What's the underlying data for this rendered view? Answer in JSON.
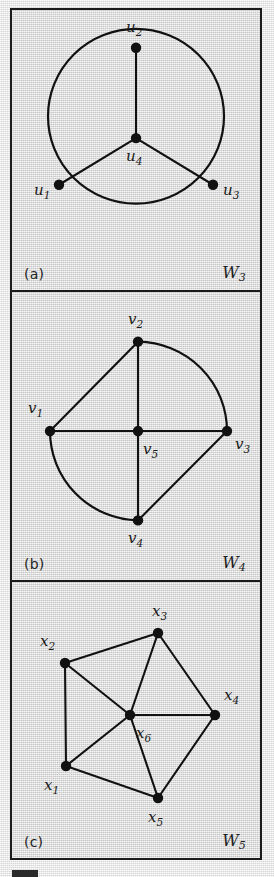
{
  "figure": {
    "background_color": "#d9d9d9",
    "stroke_color": "#111111",
    "panels": [
      {
        "id": "a",
        "caption_left": "(a)",
        "caption_right_base": "W",
        "caption_right_sub": "3",
        "graph_name": "W3",
        "vertices": [
          {
            "id": "u1",
            "base": "u",
            "sub": "1",
            "cx": 47,
            "cy": 176,
            "lx": 22,
            "ly": 186
          },
          {
            "id": "u2",
            "base": "u",
            "sub": "2",
            "cx": 124,
            "cy": 38,
            "lx": 114,
            "ly": 22
          },
          {
            "id": "u3",
            "base": "u",
            "sub": "3",
            "cx": 201,
            "cy": 176,
            "lx": 211,
            "ly": 186
          },
          {
            "id": "u4",
            "base": "u",
            "sub": "4",
            "cx": 124,
            "cy": 129,
            "lx": 114,
            "ly": 152
          }
        ],
        "edges": [
          {
            "from": "u4",
            "to": "u2",
            "kind": "straight"
          },
          {
            "from": "u4",
            "to": "u1",
            "kind": "straight"
          },
          {
            "from": "u4",
            "to": "u3",
            "kind": "straight"
          },
          {
            "from": "u2",
            "to": "u3",
            "kind": "curve"
          },
          {
            "from": "u3",
            "to": "u1",
            "kind": "curve"
          },
          {
            "from": "u1",
            "to": "u2",
            "kind": "curve"
          }
        ]
      },
      {
        "id": "b",
        "caption_left": "(b)",
        "caption_right_base": "W",
        "caption_right_sub": "4",
        "graph_name": "W4",
        "vertices": [
          {
            "id": "v1",
            "base": "v",
            "sub": "1",
            "cx": 38,
            "cy": 140,
            "lx": 16,
            "ly": 122
          },
          {
            "id": "v2",
            "base": "v",
            "sub": "2",
            "cx": 126,
            "cy": 50,
            "lx": 116,
            "ly": 32
          },
          {
            "id": "v3",
            "base": "v",
            "sub": "3",
            "cx": 215,
            "cy": 140,
            "lx": 223,
            "ly": 158
          },
          {
            "id": "v4",
            "base": "v",
            "sub": "4",
            "cx": 126,
            "cy": 230,
            "lx": 116,
            "ly": 253
          },
          {
            "id": "v5",
            "base": "v",
            "sub": "5",
            "cx": 126,
            "cy": 140,
            "lx": 131,
            "ly": 163
          }
        ],
        "edges": [
          {
            "from": "v5",
            "to": "v1",
            "kind": "straight"
          },
          {
            "from": "v5",
            "to": "v2",
            "kind": "straight"
          },
          {
            "from": "v5",
            "to": "v3",
            "kind": "straight"
          },
          {
            "from": "v5",
            "to": "v4",
            "kind": "straight"
          },
          {
            "from": "v1",
            "to": "v2",
            "kind": "straight"
          },
          {
            "from": "v3",
            "to": "v4",
            "kind": "straight"
          },
          {
            "from": "v2",
            "to": "v3",
            "kind": "curve"
          },
          {
            "from": "v1",
            "to": "v4",
            "kind": "curve"
          }
        ]
      },
      {
        "id": "c",
        "caption_left": "(c)",
        "caption_right_base": "W",
        "caption_right_sub": "5",
        "graph_name": "W5",
        "vertices": [
          {
            "id": "x1",
            "base": "x",
            "sub": "1",
            "cx": 54,
            "cy": 184,
            "lx": 32,
            "ly": 208
          },
          {
            "id": "x2",
            "base": "x",
            "sub": "2",
            "cx": 53,
            "cy": 81,
            "lx": 28,
            "ly": 64
          },
          {
            "id": "x3",
            "base": "x",
            "sub": "3",
            "cx": 146,
            "cy": 51,
            "lx": 140,
            "ly": 34
          },
          {
            "id": "x4",
            "base": "x",
            "sub": "4",
            "cx": 203,
            "cy": 133,
            "lx": 212,
            "ly": 118
          },
          {
            "id": "x5",
            "base": "x",
            "sub": "5",
            "cx": 146,
            "cy": 216,
            "lx": 136,
            "ly": 240
          },
          {
            "id": "x6",
            "base": "x",
            "sub": "6",
            "cx": 118,
            "cy": 133,
            "lx": 124,
            "ly": 156
          }
        ],
        "edges": [
          {
            "from": "x6",
            "to": "x1",
            "kind": "straight"
          },
          {
            "from": "x6",
            "to": "x2",
            "kind": "straight"
          },
          {
            "from": "x6",
            "to": "x3",
            "kind": "straight"
          },
          {
            "from": "x6",
            "to": "x4",
            "kind": "straight"
          },
          {
            "from": "x6",
            "to": "x5",
            "kind": "straight"
          },
          {
            "from": "x1",
            "to": "x2",
            "kind": "straight"
          },
          {
            "from": "x2",
            "to": "x3",
            "kind": "straight"
          },
          {
            "from": "x3",
            "to": "x4",
            "kind": "straight"
          },
          {
            "from": "x4",
            "to": "x5",
            "kind": "straight"
          },
          {
            "from": "x5",
            "to": "x1",
            "kind": "straight"
          }
        ]
      }
    ]
  }
}
